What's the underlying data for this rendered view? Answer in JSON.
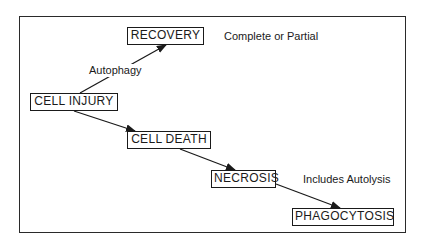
{
  "diagram": {
    "nodes": [
      {
        "id": "recovery",
        "label": "RECOVERY"
      },
      {
        "id": "cell_injury",
        "label": "CELL INJURY"
      },
      {
        "id": "cell_death",
        "label": "CELL DEATH"
      },
      {
        "id": "necrosis",
        "label": "NECROSIS"
      },
      {
        "id": "phagocytosis",
        "label": "PHAGOCYTOSIS"
      }
    ],
    "annotations": {
      "recovery_note": "Complete or Partial",
      "edge_label": "Autophagy",
      "necrosis_note": "Includes Autolysis"
    },
    "edges": [
      {
        "from": "cell_injury",
        "to": "recovery",
        "label": "Autophagy"
      },
      {
        "from": "cell_injury",
        "to": "cell_death"
      },
      {
        "from": "cell_death",
        "to": "necrosis"
      },
      {
        "from": "necrosis",
        "to": "phagocytosis"
      }
    ]
  }
}
